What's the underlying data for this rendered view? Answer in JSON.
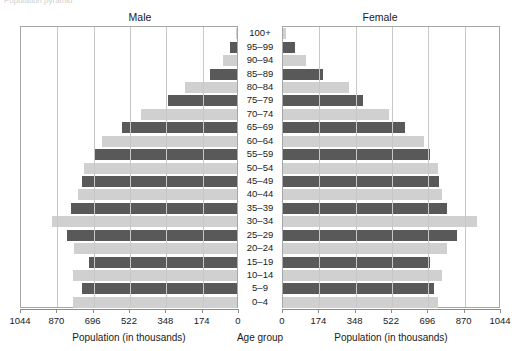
{
  "clipped_title": "Population pyramid",
  "headers": {
    "male": "Male",
    "female": "Female"
  },
  "axis_titles": {
    "male": "Population (in thousands)",
    "center": "Age group",
    "female": "Population (in thousands)"
  },
  "colors": {
    "dark_bar": "#595959",
    "light_bar": "#d0d0d0",
    "gridline": "#c8c8c8",
    "frame": "#a6a6a6",
    "axis": "#8c8c8c",
    "text": "#1a1a1a",
    "background": "#ffffff"
  },
  "chart_data": {
    "type": "bar",
    "title": "Population pyramid",
    "subtype": "population-pyramid",
    "orientation": "horizontal-diverging",
    "xlabel": "Population (in thousands)",
    "ylabel": "Age group",
    "xlim": [
      0,
      1044
    ],
    "grid": true,
    "legend_position": "none",
    "tick_values_male": [
      1044,
      870,
      696,
      522,
      348,
      174,
      0
    ],
    "tick_values_female": [
      0,
      174,
      348,
      522,
      696,
      870,
      1044
    ],
    "tick_labels_male": [
      "1044",
      "870",
      "696",
      "522",
      "348",
      "174",
      "0"
    ],
    "tick_labels_female": [
      "0",
      "174",
      "348",
      "522",
      "696",
      "870",
      "1044"
    ],
    "categories": [
      "100+",
      "95–99",
      "90–94",
      "85–89",
      "80–84",
      "75–79",
      "70–74",
      "65–69",
      "60–64",
      "55–59",
      "50–54",
      "45–49",
      "40–44",
      "35–39",
      "30–34",
      "25–29",
      "20–24",
      "15–19",
      "10–14",
      "5–9",
      "0–4"
    ],
    "series": [
      {
        "name": "Male",
        "side": "left",
        "values": [
          6,
          35,
          68,
          130,
          251,
          329,
          459,
          551,
          647,
          686,
          734,
          744,
          763,
          796,
          884,
          816,
          781,
          710,
          787,
          744,
          787
        ]
      },
      {
        "name": "Female",
        "side": "right",
        "values": [
          16,
          58,
          111,
          190,
          314,
          382,
          507,
          585,
          676,
          705,
          744,
          749,
          763,
          787,
          928,
          835,
          787,
          705,
          763,
          724,
          744
        ]
      }
    ]
  }
}
